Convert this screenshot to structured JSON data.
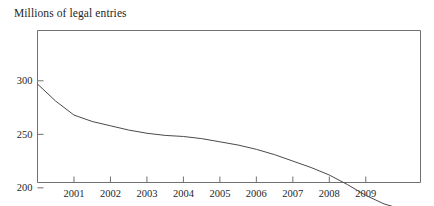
{
  "chart_data": {
    "type": "line",
    "title": "Millions of legal entries",
    "subtitle": "",
    "xlabel": "",
    "ylabel": "Millions of legal entries",
    "xlim": [
      2000.0,
      2010.5
    ],
    "ylim": [
      205,
      347
    ],
    "grid": false,
    "legend": null,
    "legend_position": "none",
    "xticks": [
      2001,
      2002,
      2003,
      2004,
      2005,
      2006,
      2007,
      2008,
      2009
    ],
    "xtick_labels": [
      "2001",
      "2002",
      "2003",
      "2004",
      "2005",
      "2006",
      "2007",
      "2008",
      "2009"
    ],
    "yticks": [
      150,
      200,
      250,
      300
    ],
    "ytick_labels": [
      "150",
      "200",
      "250",
      "300"
    ],
    "line_color": "#4a4a4a",
    "frame_color": "#707070",
    "series": [
      {
        "name": "Legal entries",
        "x": [
          2000.0,
          2000.5,
          2001.0,
          2001.5,
          2002.0,
          2002.5,
          2003.0,
          2003.5,
          2004.0,
          2004.5,
          2005.0,
          2005.5,
          2006.0,
          2006.5,
          2007.0,
          2007.5,
          2008.0,
          2008.5,
          2009.0,
          2009.5,
          2010.5
        ],
        "values": [
          297,
          281,
          268,
          262,
          258,
          254,
          251,
          249,
          248,
          246,
          243,
          240,
          236,
          231,
          225,
          219,
          212,
          203,
          193,
          185,
          175
        ]
      }
    ],
    "annotations": []
  }
}
